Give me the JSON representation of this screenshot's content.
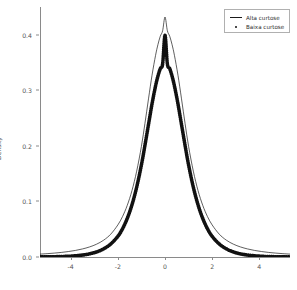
{
  "chart_data": {
    "type": "line",
    "title": "",
    "xlabel": "",
    "ylabel": "Density",
    "xlim": [
      -5.3,
      5.3
    ],
    "ylim": [
      0.0,
      0.45
    ],
    "grid": false,
    "legend_position": "top-right",
    "xticks": [
      -4,
      -2,
      0,
      2,
      4
    ],
    "xtick_labels": [
      "-4",
      "-2",
      "0",
      "2",
      "4"
    ],
    "yticks": [
      0.0,
      0.1,
      0.2,
      0.3,
      0.4
    ],
    "ytick_labels": [
      "0.0",
      "0.1",
      "0.2",
      "0.3",
      "0.4"
    ],
    "series": [
      {
        "name": "Alta curtose",
        "style": "line",
        "color": "#1a1a1a",
        "peak": 0.432,
        "x": [
          -5.3,
          -5.0,
          -4.7,
          -4.4,
          -4.1,
          -3.8,
          -3.5,
          -3.2,
          -2.9,
          -2.6,
          -2.3,
          -2.0,
          -1.8,
          -1.6,
          -1.4,
          -1.2,
          -1.0,
          -0.85,
          -0.7,
          -0.55,
          -0.4,
          -0.3,
          -0.2,
          -0.1,
          0.0,
          0.1,
          0.2,
          0.3,
          0.4,
          0.55,
          0.7,
          0.85,
          1.0,
          1.2,
          1.4,
          1.6,
          1.8,
          2.0,
          2.3,
          2.6,
          2.9,
          3.2,
          3.5,
          3.8,
          4.1,
          4.4,
          4.7,
          5.0,
          5.3
        ],
        "values": [
          0.0052,
          0.006,
          0.007,
          0.0082,
          0.0098,
          0.0118,
          0.0145,
          0.0181,
          0.0231,
          0.0303,
          0.0411,
          0.0577,
          0.0729,
          0.093,
          0.1196,
          0.1546,
          0.1991,
          0.2405,
          0.2846,
          0.3272,
          0.363,
          0.3822,
          0.3973,
          0.4073,
          0.432,
          0.4073,
          0.3973,
          0.3822,
          0.363,
          0.3272,
          0.2846,
          0.2405,
          0.1991,
          0.1546,
          0.1196,
          0.093,
          0.0729,
          0.0577,
          0.0411,
          0.0303,
          0.0231,
          0.0181,
          0.0145,
          0.0118,
          0.0098,
          0.0082,
          0.007,
          0.006,
          0.0052
        ]
      },
      {
        "name": "Baixa curtose",
        "style": "dotted-thick",
        "color": "#111111",
        "peak": 0.399,
        "x": [
          -5.3,
          -5.0,
          -4.7,
          -4.4,
          -4.1,
          -3.8,
          -3.5,
          -3.2,
          -2.9,
          -2.6,
          -2.3,
          -2.0,
          -1.8,
          -1.6,
          -1.4,
          -1.2,
          -1.0,
          -0.85,
          -0.7,
          -0.55,
          -0.4,
          -0.3,
          -0.2,
          -0.1,
          0.0,
          0.1,
          0.2,
          0.3,
          0.4,
          0.55,
          0.7,
          0.85,
          1.0,
          1.2,
          1.4,
          1.6,
          1.8,
          2.0,
          2.3,
          2.6,
          2.9,
          3.2,
          3.5,
          3.8,
          4.1,
          4.4,
          4.7,
          5.0,
          5.3
        ],
        "values": [
          0.0002,
          0.0003,
          0.0005,
          0.0008,
          0.0013,
          0.0022,
          0.0035,
          0.0056,
          0.0091,
          0.0147,
          0.0235,
          0.0371,
          0.0508,
          0.0695,
          0.094,
          0.1258,
          0.1657,
          0.2012,
          0.2385,
          0.2756,
          0.3079,
          0.3255,
          0.3391,
          0.3477,
          0.3989,
          0.3477,
          0.3391,
          0.3255,
          0.3079,
          0.2756,
          0.2385,
          0.2012,
          0.1657,
          0.1258,
          0.094,
          0.0695,
          0.0508,
          0.0371,
          0.0235,
          0.0147,
          0.0091,
          0.0056,
          0.0035,
          0.0022,
          0.0013,
          0.0008,
          0.0005,
          0.0003,
          0.0002
        ]
      }
    ]
  },
  "legend": {
    "items": [
      {
        "label": "Alta curtose",
        "glyph": "line-glyph"
      },
      {
        "label": "Baixa curtose",
        "glyph": "dot-glyph"
      }
    ]
  },
  "axes": {
    "ylabel": "Density"
  }
}
